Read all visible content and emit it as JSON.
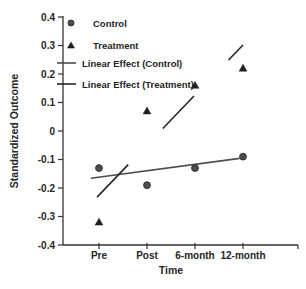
{
  "figure": {
    "background": "#ffffff",
    "text_color": "#262626",
    "axis_color": "#333333"
  },
  "chart_data": {
    "type": "scatter",
    "title": "",
    "xlabel": "Time",
    "ylabel": "Standardized Outcome",
    "categories": [
      "Pre",
      "Post",
      "6-month",
      "12-month"
    ],
    "ylim": [
      -0.4,
      0.4
    ],
    "ytick_step": 0.1,
    "yticklabels": [
      "0.4",
      "0.3",
      "0.2",
      "0.1",
      "0",
      "-0.1",
      "-0.2",
      "-0.3",
      "-0.4"
    ],
    "grid": false,
    "legend_position": "upper-left-inside",
    "series": [
      {
        "name": "Control",
        "marker": "circle",
        "color": "#4d4d4d",
        "edge_color": "#333333",
        "values": [
          -0.13,
          -0.19,
          -0.13,
          -0.09
        ]
      },
      {
        "name": "Treatment",
        "marker": "triangle",
        "color": "#1f1f1f",
        "edge_color": "#1f1f1f",
        "values": [
          -0.32,
          0.07,
          0.16,
          0.22
        ]
      }
    ],
    "fit_lines": [
      {
        "name": "Linear Effect (Control)",
        "style": "solid",
        "color": "#4d4d4d",
        "x1": -0.17,
        "y1": -0.166,
        "x2": 2.93,
        "y2": -0.096
      },
      {
        "name": "Linear Effect (Treatment)",
        "style": "long-dash",
        "color": "#262626",
        "x1": -0.04,
        "y1": -0.232,
        "x2": 3.0,
        "y2": 0.302
      }
    ],
    "legend": [
      {
        "label": "Control",
        "key": "circle"
      },
      {
        "label": "Treatment",
        "key": "triangle"
      },
      {
        "label": "Linear Effect (Control)",
        "key": "line"
      },
      {
        "label": "Linear Effect (Treatment)",
        "key": "line"
      }
    ]
  }
}
